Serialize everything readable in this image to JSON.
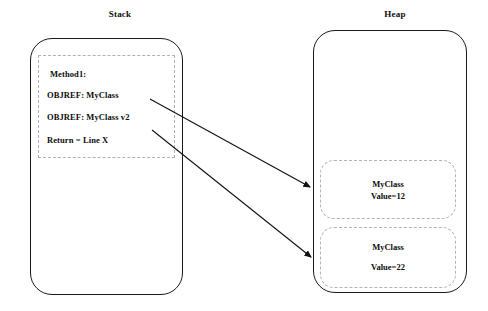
{
  "diagram": {
    "regions": {
      "stack": {
        "title": "Stack",
        "frame_label": "method-frame",
        "lines": [
          "Method1:",
          "OBJREF: MyClass",
          "OBJREF: MyClass v2",
          "Return = Line X"
        ]
      },
      "heap": {
        "title": "Heap",
        "objects": [
          {
            "name": "MyClass",
            "value": "Value=12"
          },
          {
            "name": "MyClass",
            "value": "Value=22"
          }
        ]
      }
    },
    "arrows": [
      {
        "from": "OBJREF: MyClass",
        "to": "MyClass Value=12"
      },
      {
        "from": "OBJREF: MyClass v2",
        "to": "MyClass Value=22"
      }
    ],
    "colors": {
      "line": "#1a1a1a",
      "dashed": "#b3b3b3",
      "text": "#0d0d0d",
      "background": "#ffffff"
    }
  }
}
